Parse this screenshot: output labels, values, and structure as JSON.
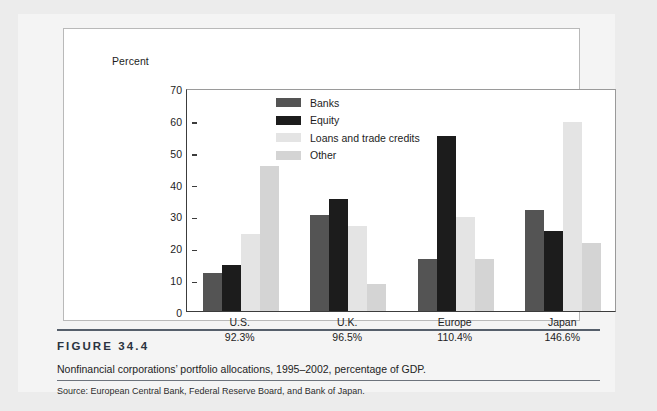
{
  "figure": {
    "number": "FIGURE  34.4",
    "caption": "Nonfinancial corporations’ portfolio allocations, 1995–2002, percentage of GDP.",
    "source": "Source: European Central Bank, Federal Reserve Board, and Bank of Japan."
  },
  "chart_data": {
    "type": "bar",
    "title": "",
    "xlabel": "",
    "ylabel": "Percent",
    "ylim": [
      0,
      70
    ],
    "yticks": [
      0,
      10,
      20,
      30,
      40,
      50,
      60,
      70
    ],
    "grid": false,
    "legend_position": "inside-top-center",
    "categories": [
      "U.S.",
      "U.K.",
      "Europe",
      "Japan"
    ],
    "category_sublabels": [
      "92.3%",
      "96.5%",
      "110.4%",
      "146.6%"
    ],
    "series": [
      {
        "name": "Banks",
        "color": "#545454",
        "values": [
          12.0,
          30.2,
          16.2,
          31.6
        ]
      },
      {
        "name": "Equity",
        "color": "#1c1c1c",
        "values": [
          14.4,
          35.3,
          55.0,
          25.2
        ]
      },
      {
        "name": "Loans and trade credits",
        "color": "#e4e4e4",
        "values": [
          24.3,
          26.7,
          29.4,
          59.4
        ]
      },
      {
        "name": "Other",
        "color": "#d4d4d4",
        "values": [
          45.5,
          8.4,
          16.2,
          21.2
        ]
      }
    ]
  }
}
